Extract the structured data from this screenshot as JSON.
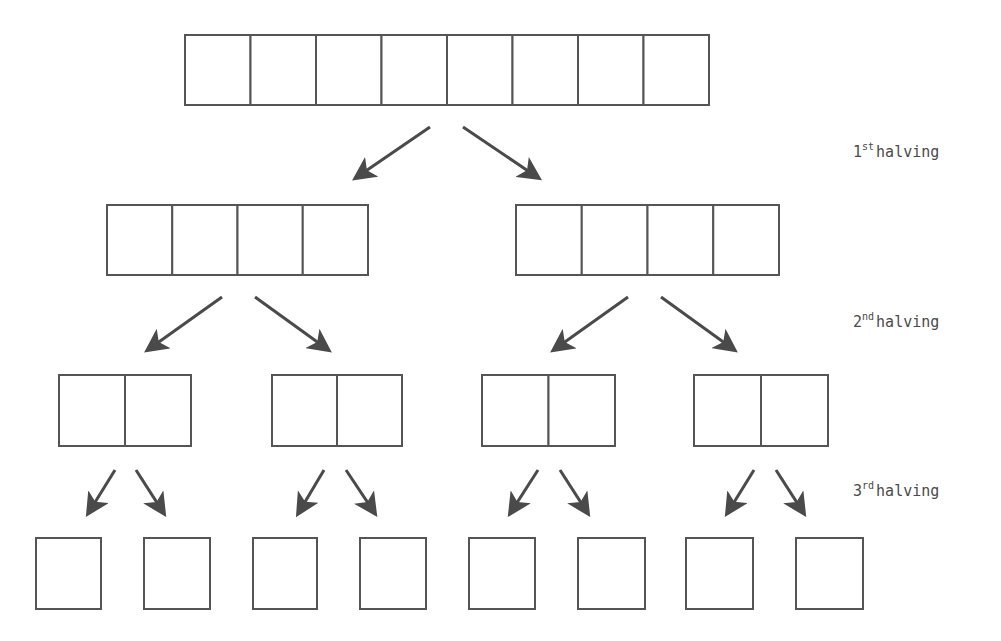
{
  "diagram": {
    "stroke_color": "#555555",
    "arrow_color": "#4a4a4a",
    "levels": [
      {
        "cells_per_group": 8,
        "groups": [
          {
            "x": 185,
            "y": 35,
            "w": 524,
            "h": 70
          }
        ]
      },
      {
        "cells_per_group": 4,
        "groups": [
          {
            "x": 107,
            "y": 205,
            "w": 261,
            "h": 70
          },
          {
            "x": 516,
            "y": 205,
            "w": 263,
            "h": 70
          }
        ]
      },
      {
        "cells_per_group": 2,
        "groups": [
          {
            "x": 59,
            "y": 375,
            "w": 132,
            "h": 71
          },
          {
            "x": 272,
            "y": 375,
            "w": 130,
            "h": 71
          },
          {
            "x": 482,
            "y": 375,
            "w": 133,
            "h": 71
          },
          {
            "x": 694,
            "y": 375,
            "w": 134,
            "h": 71
          }
        ]
      },
      {
        "cells_per_group": 1,
        "groups": [
          {
            "x": 36,
            "y": 538,
            "w": 65,
            "h": 71
          },
          {
            "x": 144,
            "y": 538,
            "w": 66,
            "h": 71
          },
          {
            "x": 253,
            "y": 538,
            "w": 64,
            "h": 71
          },
          {
            "x": 360,
            "y": 538,
            "w": 66,
            "h": 71
          },
          {
            "x": 469,
            "y": 538,
            "w": 66,
            "h": 71
          },
          {
            "x": 578,
            "y": 538,
            "w": 67,
            "h": 71
          },
          {
            "x": 686,
            "y": 538,
            "w": 67,
            "h": 71
          },
          {
            "x": 796,
            "y": 538,
            "w": 67,
            "h": 71
          }
        ]
      }
    ],
    "arrows": [
      {
        "x1": 430,
        "y1": 127,
        "x2": 357,
        "y2": 177
      },
      {
        "x1": 463,
        "y1": 127,
        "x2": 537,
        "y2": 177
      },
      {
        "x1": 222,
        "y1": 297,
        "x2": 149,
        "y2": 349
      },
      {
        "x1": 255,
        "y1": 297,
        "x2": 327,
        "y2": 349
      },
      {
        "x1": 628,
        "y1": 297,
        "x2": 555,
        "y2": 349
      },
      {
        "x1": 661,
        "y1": 297,
        "x2": 733,
        "y2": 349
      },
      {
        "x1": 115,
        "y1": 470,
        "x2": 89,
        "y2": 512
      },
      {
        "x1": 136,
        "y1": 470,
        "x2": 163,
        "y2": 512
      },
      {
        "x1": 324,
        "y1": 470,
        "x2": 299,
        "y2": 512
      },
      {
        "x1": 346,
        "y1": 470,
        "x2": 374,
        "y2": 512
      },
      {
        "x1": 538,
        "y1": 470,
        "x2": 511,
        "y2": 512
      },
      {
        "x1": 560,
        "y1": 470,
        "x2": 587,
        "y2": 512
      },
      {
        "x1": 754,
        "y1": 470,
        "x2": 728,
        "y2": 512
      },
      {
        "x1": 776,
        "y1": 470,
        "x2": 803,
        "y2": 512
      }
    ],
    "labels": [
      {
        "num": "1",
        "suffix": "st",
        "text": "halving",
        "x": 853,
        "y": 142
      },
      {
        "num": "2",
        "suffix": "nd",
        "text": "halving",
        "x": 853,
        "y": 312
      },
      {
        "num": "3",
        "suffix": "rd",
        "text": "halving",
        "x": 853,
        "y": 481
      }
    ]
  }
}
